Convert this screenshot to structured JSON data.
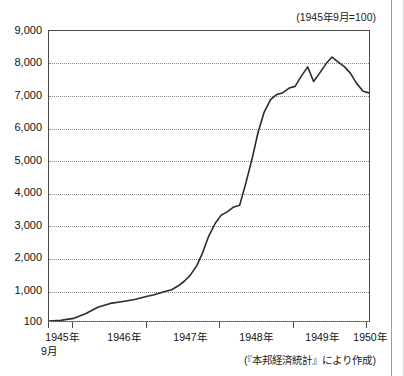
{
  "figure": {
    "title_clipped": "",
    "unit_note": "(1945年9月=100)",
    "source_note": "(『本邦経済統計』により作成)"
  },
  "axes": {
    "y_labels": [
      "9,000",
      "8,000",
      "7,000",
      "6,000",
      "5,000",
      "4,000",
      "3,000",
      "2,000",
      "1,000",
      "100"
    ],
    "x_labels": [
      "1945年",
      "1946年",
      "1947年",
      "1948年",
      "1949年",
      "1950年"
    ],
    "x_sublabel": "9月"
  },
  "chart_data": {
    "type": "line",
    "title": "",
    "xlabel": "",
    "ylabel": "",
    "unit_note": "(1945年9月=100)",
    "source": "(『本邦経済統計』により作成)",
    "xlim": [
      1945.67,
      1950.0
    ],
    "ylim": [
      100,
      9000
    ],
    "yticks": [
      100,
      1000,
      2000,
      3000,
      4000,
      5000,
      6000,
      7000,
      8000,
      9000
    ],
    "ytick_labels": [
      "100",
      "1,000",
      "2,000",
      "3,000",
      "4,000",
      "5,000",
      "6,000",
      "7,000",
      "8,000",
      "9,000"
    ],
    "xticks": [
      1945.67,
      1946.0,
      1947.0,
      1948.0,
      1949.0,
      1950.0
    ],
    "xtick_labels": [
      "1945年",
      "1946年",
      "1947年",
      "1948年",
      "1949年",
      "1950年"
    ],
    "grid": "horizontal-dotted",
    "legend": "none",
    "series": [
      {
        "name": "物価指数",
        "color": "#2b2b2b",
        "x": [
          1945.67,
          1945.83,
          1946.0,
          1946.17,
          1946.33,
          1946.5,
          1946.67,
          1946.83,
          1947.0,
          1947.08,
          1947.17,
          1947.25,
          1947.33,
          1947.42,
          1947.5,
          1947.58,
          1947.67,
          1947.75,
          1947.83,
          1947.92,
          1948.0,
          1948.08,
          1948.17,
          1948.25,
          1948.33,
          1948.42,
          1948.5,
          1948.58,
          1948.67,
          1948.75,
          1948.83,
          1948.92,
          1949.0,
          1949.08,
          1949.17,
          1949.25,
          1949.33,
          1949.42,
          1949.5,
          1949.58,
          1949.67,
          1949.75,
          1949.83,
          1949.92,
          1950.0
        ],
        "y": [
          100,
          120,
          180,
          330,
          520,
          640,
          700,
          760,
          860,
          900,
          960,
          1010,
          1060,
          1180,
          1320,
          1500,
          1800,
          2200,
          2700,
          3100,
          3350,
          3450,
          3600,
          3650,
          4300,
          5100,
          5900,
          6500,
          6900,
          7050,
          7100,
          7250,
          7300,
          7600,
          7900,
          7450,
          7700,
          8000,
          8200,
          8050,
          7900,
          7700,
          7400,
          7150,
          7100
        ]
      }
    ]
  }
}
